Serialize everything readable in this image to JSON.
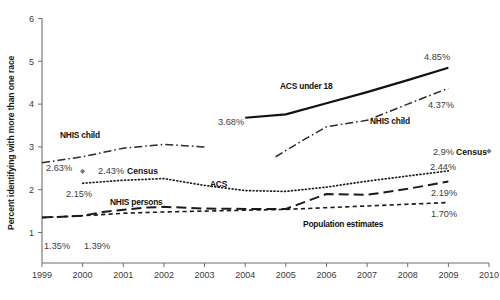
{
  "chart_data": {
    "type": "line",
    "title": "",
    "xlabel": "",
    "ylabel": "Percent identifying with more than one race",
    "xlim": [
      1999,
      2010
    ],
    "ylim": [
      1,
      6
    ],
    "yticks": [
      "1",
      "2",
      "3",
      "4",
      "5",
      "6"
    ],
    "xticks": [
      "1999",
      "2000",
      "2001",
      "2002",
      "2003",
      "2004",
      "2005",
      "2006",
      "2007",
      "2008",
      "2009",
      "2010"
    ],
    "grid": false,
    "legend_position": "inline-annotations",
    "series": [
      {
        "name": "ACS under 18",
        "style": "solid-thick",
        "label": "ACS under 18",
        "label_x": 2006.0,
        "label_y": 4.28,
        "points": [
          {
            "x": 2004.0,
            "y": 3.68
          },
          {
            "x": 2005.0,
            "y": 3.76
          },
          {
            "x": 2006.0,
            "y": 4.02
          },
          {
            "x": 2007.0,
            "y": 4.28
          },
          {
            "x": 2008.0,
            "y": 4.56
          },
          {
            "x": 2009.0,
            "y": 4.85
          }
        ],
        "start_label": "3.68%",
        "end_label": "4.85%"
      },
      {
        "name": "NHIS child",
        "style": "dash-dot",
        "label": "NHIS child",
        "label_x": 2007.1,
        "label_y": 3.68,
        "points_segment_a": [
          {
            "x": 1999.0,
            "y": 2.63
          },
          {
            "x": 2000.0,
            "y": 2.77
          },
          {
            "x": 2001.0,
            "y": 2.97
          },
          {
            "x": 2002.0,
            "y": 3.06
          },
          {
            "x": 2003.0,
            "y": 3.0
          }
        ],
        "points_segment_b": [
          {
            "x": 2004.75,
            "y": 2.77
          },
          {
            "x": 2005.5,
            "y": 3.2
          },
          {
            "x": 2006.0,
            "y": 3.47
          },
          {
            "x": 2007.0,
            "y": 3.62
          },
          {
            "x": 2008.0,
            "y": 4.0
          },
          {
            "x": 2009.0,
            "y": 4.37
          }
        ],
        "start_label": "2.63%",
        "end_label": "4.37%"
      },
      {
        "name": "ACS",
        "style": "dotted",
        "label": "ACS",
        "label_x": 2005.3,
        "label_y": 2.22,
        "points": [
          {
            "x": 2000.0,
            "y": 2.15
          },
          {
            "x": 2001.0,
            "y": 2.22
          },
          {
            "x": 2002.0,
            "y": 2.26
          },
          {
            "x": 2003.0,
            "y": 2.1
          },
          {
            "x": 2004.0,
            "y": 1.98
          },
          {
            "x": 2005.0,
            "y": 1.96
          },
          {
            "x": 2006.0,
            "y": 2.06
          },
          {
            "x": 2007.0,
            "y": 2.2
          },
          {
            "x": 2008.0,
            "y": 2.32
          },
          {
            "x": 2009.0,
            "y": 2.44
          }
        ],
        "start_label": "2.15%",
        "end_label": "2.44%"
      },
      {
        "name": "NHIS persons",
        "style": "long-dash",
        "label": "NHIS persons",
        "label_x": 2002.0,
        "label_y": 1.72,
        "points": [
          {
            "x": 1999.0,
            "y": 1.35
          },
          {
            "x": 2000.0,
            "y": 1.39
          },
          {
            "x": 2000.5,
            "y": 1.48
          },
          {
            "x": 2001.5,
            "y": 1.58
          },
          {
            "x": 2002.0,
            "y": 1.6
          },
          {
            "x": 2003.0,
            "y": 1.56
          },
          {
            "x": 2004.0,
            "y": 1.55
          },
          {
            "x": 2005.0,
            "y": 1.55
          },
          {
            "x": 2006.0,
            "y": 1.9
          },
          {
            "x": 2007.0,
            "y": 1.88
          },
          {
            "x": 2008.0,
            "y": 2.02
          },
          {
            "x": 2009.0,
            "y": 2.19
          }
        ],
        "start_label": "1.35%",
        "end_label": "2.19%"
      },
      {
        "name": "Population estimates",
        "style": "short-dash",
        "label": "Population estimates",
        "label_x": 2006.2,
        "label_y": 1.46,
        "points": [
          {
            "x": 1999.0,
            "y": 1.35
          },
          {
            "x": 2000.0,
            "y": 1.39
          },
          {
            "x": 2001.0,
            "y": 1.45
          },
          {
            "x": 2002.0,
            "y": 1.48
          },
          {
            "x": 2003.0,
            "y": 1.5
          },
          {
            "x": 2004.0,
            "y": 1.52
          },
          {
            "x": 2005.0,
            "y": 1.54
          },
          {
            "x": 2006.0,
            "y": 1.58
          },
          {
            "x": 2007.0,
            "y": 1.62
          },
          {
            "x": 2008.0,
            "y": 1.66
          },
          {
            "x": 2009.0,
            "y": 1.7
          }
        ],
        "end_label": "1.70%"
      },
      {
        "name": "Census",
        "style": "marker-only",
        "points": [
          {
            "x": 2000.0,
            "y": 2.43,
            "label": "2.43% Census"
          },
          {
            "x": 2010.0,
            "y": 2.9,
            "label": "2.9% Census"
          }
        ]
      }
    ],
    "annotations": [
      {
        "text": "3.68%",
        "x": 2004.0,
        "y": 3.48
      },
      {
        "text": "4.85%",
        "x": 2008.65,
        "y": 5.05
      },
      {
        "text": "2.63%",
        "x": 1999.05,
        "y": 2.4
      },
      {
        "text": "4.37%",
        "x": 2008.75,
        "y": 4.1
      },
      {
        "text": "2.15%",
        "x": 2000.15,
        "y": 1.93
      },
      {
        "text": "2.44%",
        "x": 2008.8,
        "y": 2.62
      },
      {
        "text": "2.19%",
        "x": 2008.85,
        "y": 2.02
      },
      {
        "text": "1.70%",
        "x": 2008.85,
        "y": 1.53
      },
      {
        "text": "1.35%",
        "x": 1999.05,
        "y": 1.15
      },
      {
        "text": "1.39%",
        "x": 2000.1,
        "y": 1.15
      }
    ]
  },
  "axis": {
    "ylabel": "Percent identifying with more than one race",
    "ytick_1": "1",
    "ytick_2": "2",
    "ytick_3": "3",
    "ytick_4": "4",
    "ytick_5": "5",
    "ytick_6": "6",
    "xtick_1999": "1999",
    "xtick_2000": "2000",
    "xtick_2001": "2001",
    "xtick_2002": "2002",
    "xtick_2003": "2003",
    "xtick_2004": "2004",
    "xtick_2005": "2005",
    "xtick_2006": "2006",
    "xtick_2007": "2007",
    "xtick_2008": "2008",
    "xtick_2009": "2009",
    "xtick_2010": "2010"
  },
  "labels": {
    "acs_under_18": "ACS under 18",
    "nhis_child_left": "NHIS child",
    "nhis_child_right": "NHIS child",
    "acs": "ACS",
    "nhis_persons": "NHIS persons",
    "population_estimates": "Population estimates",
    "census_left_value": "2.43%",
    "census_left_name": "Census",
    "census_right_value": "2.9%",
    "census_right_name": "Census",
    "v_3_68": "3.68%",
    "v_4_85": "4.85%",
    "v_2_63": "2.63%",
    "v_4_37": "4.37%",
    "v_2_15": "2.15%",
    "v_2_44": "2.44%",
    "v_2_19": "2.19%",
    "v_1_70": "1.70%",
    "v_1_35": "1.35%",
    "v_1_39": "1.39%"
  },
  "colors": {
    "background": "#ffffff",
    "line": "#111111",
    "axis": "#6e6e6e",
    "value_text": "#3c3c3c",
    "marker": "#7a7a7a"
  }
}
